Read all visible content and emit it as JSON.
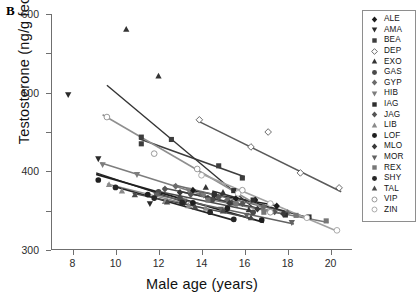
{
  "panel": {
    "letter": "B"
  },
  "axes": {
    "ylabel": "Testosterone (ng/g feces)",
    "xlabel": "Male age (years)",
    "yticks": [
      "0",
      "100",
      "200",
      "300",
      "400",
      "500",
      "600"
    ],
    "xticks": [
      "8",
      "10",
      "12",
      "14",
      "16",
      "18",
      "20"
    ],
    "ylim": [
      0,
      600
    ],
    "xlim": [
      7.0,
      21.0
    ]
  },
  "legend": {
    "entries": [
      {
        "label": "ALE",
        "marker": "diamond-filled",
        "color": "#1c1c1c"
      },
      {
        "label": "AMA",
        "marker": "triangle-down",
        "color": "#2a2a2a"
      },
      {
        "label": "BEA",
        "marker": "square-filled",
        "color": "#3d3d3d"
      },
      {
        "label": "DEP",
        "marker": "diamond-open",
        "color": "#5a5a5a"
      },
      {
        "label": "EXO",
        "marker": "triangle-up",
        "color": "#343434"
      },
      {
        "label": "GAS",
        "marker": "circle-filled",
        "color": "#4a4a4a"
      },
      {
        "label": "GYP",
        "marker": "diamond-filled",
        "color": "#6b6b6b"
      },
      {
        "label": "HIB",
        "marker": "triangle-down",
        "color": "#7d7d7d"
      },
      {
        "label": "IAG",
        "marker": "square-filled",
        "color": "#2f2f2f"
      },
      {
        "label": "JAG",
        "marker": "diamond-filled",
        "color": "#555555"
      },
      {
        "label": "LIB",
        "marker": "triangle-up",
        "color": "#8a8a8a"
      },
      {
        "label": "LOF",
        "marker": "circle-filled",
        "color": "#1f1f1f"
      },
      {
        "label": "MLO",
        "marker": "diamond-filled",
        "color": "#3a3a3a"
      },
      {
        "label": "MOR",
        "marker": "triangle-down",
        "color": "#626262"
      },
      {
        "label": "REX",
        "marker": "square-filled",
        "color": "#777777"
      },
      {
        "label": "SHY",
        "marker": "circle-filled",
        "color": "#262626"
      },
      {
        "label": "TAL",
        "marker": "triangle-up",
        "color": "#494949"
      },
      {
        "label": "VIP",
        "marker": "circle-open",
        "color": "#8f8f8f"
      },
      {
        "label": "ZIN",
        "marker": "circle-open",
        "color": "#a2a2a2"
      }
    ]
  },
  "chart_data": {
    "type": "scatter",
    "title": "",
    "xlabel": "Male age (years)",
    "ylabel": "Testosterone (ng/g feces)",
    "xlim": [
      7.0,
      21.0
    ],
    "ylim": [
      0,
      600
    ],
    "grid": false,
    "legend_position": "right-outside",
    "note": "Each series is one individual male; points are observations and the straight line is that individual's fitted regression of fecal testosterone on age. All fitted slopes are negative.",
    "series": [
      {
        "name": "ALE",
        "marker": "diamond-filled",
        "color": "#1c1c1c",
        "linewidth": 1.6,
        "points": [
          [
            13.6,
            152
          ],
          [
            14.6,
            139
          ],
          [
            15.6,
            131
          ],
          [
            16.5,
            127
          ],
          [
            17.5,
            112
          ]
        ],
        "fit": {
          "x": [
            13.5,
            17.6
          ],
          "y": [
            152,
            112
          ]
        }
      },
      {
        "name": "AMA",
        "marker": "triangle-down",
        "color": "#2a2a2a",
        "linewidth": 1.4,
        "points": [
          [
            7.8,
            395
          ],
          [
            9.2,
            232
          ],
          [
            11.6,
            118
          ],
          [
            13.2,
            120
          ]
        ],
        "fit": {
          "x": [
            9.1,
            13.3
          ],
          "y": [
            196,
            120
          ]
        }
      },
      {
        "name": "BEA",
        "marker": "square-filled",
        "color": "#3d3d3d",
        "linewidth": 1.6,
        "points": [
          [
            11.2,
            270
          ],
          [
            11.2,
            287
          ],
          [
            12.6,
            281
          ],
          [
            14.8,
            214
          ],
          [
            15.9,
            183
          ]
        ],
        "fit": {
          "x": [
            11.1,
            16.0
          ],
          "y": [
            283,
            186
          ]
        }
      },
      {
        "name": "DEP",
        "marker": "diamond-open",
        "color": "#5a5a5a",
        "linewidth": 1.5,
        "points": [
          [
            13.9,
            331
          ],
          [
            16.3,
            262
          ],
          [
            17.1,
            300
          ],
          [
            18.6,
            196
          ],
          [
            20.4,
            158
          ]
        ],
        "fit": {
          "x": [
            13.8,
            20.5
          ],
          "y": [
            329,
            148
          ]
        }
      },
      {
        "name": "EXO",
        "marker": "triangle-up",
        "color": "#343434",
        "linewidth": 1.4,
        "points": [
          [
            10.5,
            561
          ],
          [
            12.0,
            442
          ],
          [
            14.2,
            159
          ],
          [
            15.0,
            146
          ],
          [
            16.2,
            102
          ]
        ],
        "fit": {
          "x": [
            9.6,
            16.4
          ],
          "y": [
            419,
            108
          ]
        }
      },
      {
        "name": "GAS",
        "marker": "circle-filled",
        "color": "#4a4a4a",
        "linewidth": 1.5,
        "points": [
          [
            12.0,
            148
          ],
          [
            13.0,
            132
          ],
          [
            14.5,
            128
          ],
          [
            15.4,
            120
          ],
          [
            16.4,
            96
          ]
        ],
        "fit": {
          "x": [
            11.9,
            16.5
          ],
          "y": [
            150,
            98
          ]
        }
      },
      {
        "name": "GYP",
        "marker": "diamond-filled",
        "color": "#6b6b6b",
        "linewidth": 1.5,
        "points": [
          [
            12.8,
            162
          ],
          [
            14.0,
            142
          ],
          [
            15.2,
            128
          ],
          [
            16.9,
            110
          ],
          [
            18.0,
            95
          ]
        ],
        "fit": {
          "x": [
            12.7,
            18.1
          ],
          "y": [
            166,
            94
          ]
        }
      },
      {
        "name": "HIB",
        "marker": "triangle-down",
        "color": "#7d7d7d",
        "linewidth": 1.5,
        "points": [
          [
            9.4,
            217
          ],
          [
            11.0,
            192
          ],
          [
            13.4,
            152
          ],
          [
            14.1,
            139
          ],
          [
            15.6,
            116
          ]
        ],
        "fit": {
          "x": [
            9.3,
            15.7
          ],
          "y": [
            222,
            112
          ]
        }
      },
      {
        "name": "IAG",
        "marker": "square-filled",
        "color": "#2f2f2f",
        "linewidth": 1.6,
        "points": [
          [
            14.6,
            141
          ],
          [
            15.5,
            151
          ],
          [
            16.4,
            127
          ],
          [
            17.9,
            89
          ],
          [
            19.0,
            84
          ]
        ],
        "fit": {
          "x": [
            14.5,
            19.1
          ],
          "y": [
            150,
            80
          ]
        }
      },
      {
        "name": "JAG",
        "marker": "diamond-filled",
        "color": "#555555",
        "linewidth": 1.5,
        "points": [
          [
            12.3,
            155
          ],
          [
            13.5,
            141
          ],
          [
            14.8,
            134
          ],
          [
            15.9,
            118
          ],
          [
            17.4,
            97
          ]
        ],
        "fit": {
          "x": [
            12.2,
            17.5
          ],
          "y": [
            158,
            96
          ]
        }
      },
      {
        "name": "LIB",
        "marker": "triangle-up",
        "color": "#8a8a8a",
        "linewidth": 1.4,
        "points": [
          [
            9.7,
            166
          ],
          [
            10.3,
            150
          ],
          [
            12.3,
            123
          ],
          [
            13.4,
            112
          ],
          [
            14.2,
            106
          ]
        ],
        "fit": {
          "x": [
            9.6,
            14.3
          ],
          "y": [
            168,
            104
          ]
        }
      },
      {
        "name": "LOF",
        "marker": "circle-filled",
        "color": "#1f1f1f",
        "linewidth": 1.8,
        "points": [
          [
            9.2,
            178
          ],
          [
            11.5,
            141
          ],
          [
            13.6,
            120
          ],
          [
            15.2,
            106
          ],
          [
            16.8,
            76
          ]
        ],
        "fit": {
          "x": [
            9.1,
            16.9
          ],
          "y": [
            192,
            70
          ]
        }
      },
      {
        "name": "MLO",
        "marker": "diamond-filled",
        "color": "#3a3a3a",
        "linewidth": 1.5,
        "points": [
          [
            13.0,
            146
          ],
          [
            14.3,
            132
          ],
          [
            15.3,
            119
          ],
          [
            16.6,
            104
          ],
          [
            17.8,
            92
          ]
        ],
        "fit": {
          "x": [
            12.9,
            17.9
          ],
          "y": [
            150,
            90
          ]
        }
      },
      {
        "name": "MOR",
        "marker": "triangle-down",
        "color": "#626262",
        "linewidth": 1.5,
        "points": [
          [
            11.9,
            140
          ],
          [
            13.2,
            125
          ],
          [
            14.9,
            104
          ],
          [
            16.1,
            88
          ],
          [
            18.2,
            70
          ]
        ],
        "fit": {
          "x": [
            11.8,
            18.3
          ],
          "y": [
            142,
            66
          ]
        }
      },
      {
        "name": "REX",
        "marker": "square-filled",
        "color": "#777777",
        "linewidth": 1.5,
        "points": [
          [
            14.3,
            127
          ],
          [
            15.6,
            118
          ],
          [
            16.9,
            96
          ],
          [
            18.4,
            88
          ],
          [
            19.8,
            74
          ]
        ],
        "fit": {
          "x": [
            14.2,
            19.9
          ],
          "y": [
            130,
            70
          ]
        }
      },
      {
        "name": "SHY",
        "marker": "circle-filled",
        "color": "#262626",
        "linewidth": 1.6,
        "points": [
          [
            10.0,
            159
          ],
          [
            11.8,
            132
          ],
          [
            13.1,
            121
          ],
          [
            14.4,
            96
          ],
          [
            15.5,
            78
          ]
        ],
        "fit": {
          "x": [
            9.9,
            15.6
          ],
          "y": [
            162,
            74
          ]
        }
      },
      {
        "name": "TAL",
        "marker": "triangle-up",
        "color": "#494949",
        "linewidth": 1.5,
        "points": [
          [
            10.9,
            140
          ],
          [
            12.4,
            122
          ],
          [
            13.7,
            109
          ],
          [
            15.0,
            99
          ],
          [
            16.3,
            82
          ]
        ],
        "fit": {
          "x": [
            10.8,
            16.4
          ],
          "y": [
            144,
            80
          ]
        }
      },
      {
        "name": "VIP",
        "marker": "circle-open",
        "color": "#8f8f8f",
        "linewidth": 1.6,
        "points": [
          [
            9.6,
            338
          ],
          [
            11.8,
            245
          ],
          [
            13.8,
            206
          ],
          [
            15.9,
            152
          ],
          [
            17.2,
            96
          ]
        ],
        "fit": {
          "x": [
            9.4,
            17.3
          ],
          "y": [
            344,
            92
          ]
        }
      },
      {
        "name": "ZIN",
        "marker": "circle-open",
        "color": "#a2a2a2",
        "linewidth": 1.6,
        "points": [
          [
            14.0,
            190
          ],
          [
            15.7,
            144
          ],
          [
            17.2,
            118
          ],
          [
            18.9,
            82
          ],
          [
            20.3,
            50
          ]
        ],
        "fit": {
          "x": [
            13.9,
            20.4
          ],
          "y": [
            196,
            46
          ]
        }
      }
    ]
  }
}
